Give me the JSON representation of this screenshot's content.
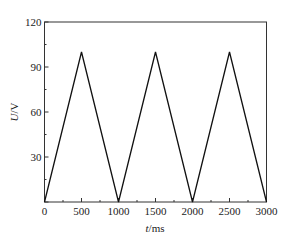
{
  "chart_data": {
    "type": "line",
    "title": "",
    "xlabel": "t/ms",
    "xlabel_italic": "t",
    "xlabel_unit": "/ms",
    "ylabel": "U/V",
    "ylabel_italic": "U",
    "ylabel_unit": "/V",
    "xlim": [
      0,
      3000
    ],
    "ylim": [
      0,
      120
    ],
    "xticks": [
      0,
      500,
      1000,
      1500,
      2000,
      2500,
      3000
    ],
    "yticks": [
      30,
      60,
      90,
      120
    ],
    "y_zero_label_shared": true,
    "grid": false,
    "legend": null,
    "series": [
      {
        "name": "U",
        "color": "#111111",
        "x": [
          0,
          500,
          1000,
          1500,
          2000,
          2500,
          3000
        ],
        "y": [
          0,
          100,
          0,
          100,
          0,
          100,
          0
        ]
      }
    ]
  }
}
